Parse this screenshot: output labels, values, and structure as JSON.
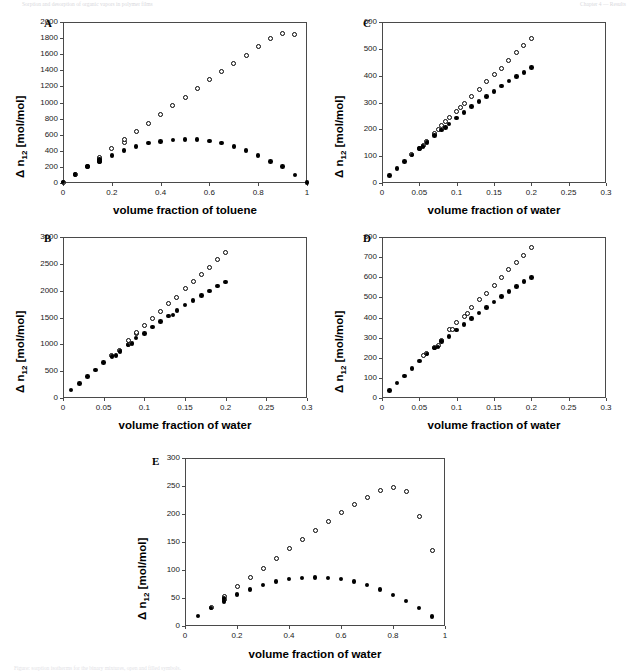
{
  "header": {
    "left": "Sorption and desorption of organic vapors in polymer films",
    "right": "Chapter 4 — Results"
  },
  "figure_caption": "Figure: sorption isotherms for the binary mixtures, open and filled symbols.",
  "axis_common": {
    "ylabel_prefix": "Δ n",
    "ylabel_sub": "12",
    "ylabel_suffix": " [mol/mol]"
  },
  "chart_data": [
    {
      "id": "A",
      "type": "scatter",
      "title": "A",
      "xlabel": "volume fraction of toluene",
      "ylabel": "Δ n12 [mol/mol]",
      "xlim": [
        0,
        1
      ],
      "ylim": [
        0,
        2000
      ],
      "xticks": [
        0,
        0.2,
        0.4,
        0.6,
        0.8,
        1
      ],
      "xtick_labels": [
        "0",
        "0.2",
        "0.4",
        "0.6",
        "0.8",
        "1"
      ],
      "yticks": [
        0,
        200,
        400,
        600,
        800,
        1000,
        1200,
        1400,
        1600,
        1800,
        2000
      ],
      "ytick_labels": [
        "0",
        "200",
        "400",
        "600",
        "800",
        "1000",
        "1200",
        "1400",
        "1600",
        "1800",
        "2000"
      ],
      "grid": false,
      "legend": "none",
      "series": [
        {
          "name": "open-circles",
          "marker": "open",
          "x": [
            0.0,
            0.05,
            0.1,
            0.15,
            0.15,
            0.2,
            0.25,
            0.25,
            0.3,
            0.35,
            0.4,
            0.45,
            0.5,
            0.55,
            0.6,
            0.65,
            0.7,
            0.75,
            0.8,
            0.85,
            0.9,
            0.95
          ],
          "y": [
            10,
            105,
            205,
            270,
            320,
            430,
            500,
            535,
            635,
            745,
            855,
            960,
            1065,
            1175,
            1280,
            1380,
            1480,
            1590,
            1690,
            1790,
            1860,
            1840
          ]
        },
        {
          "name": "filled-circles",
          "marker": "filled",
          "x": [
            0.0,
            0.05,
            0.1,
            0.15,
            0.15,
            0.2,
            0.25,
            0.3,
            0.35,
            0.4,
            0.45,
            0.5,
            0.55,
            0.6,
            0.65,
            0.7,
            0.75,
            0.8,
            0.85,
            0.9,
            0.95,
            1.0
          ],
          "y": [
            10,
            105,
            205,
            265,
            295,
            345,
            405,
            450,
            495,
            515,
            535,
            540,
            538,
            520,
            495,
            455,
            405,
            345,
            270,
            205,
            100,
            8
          ]
        }
      ]
    },
    {
      "id": "B",
      "type": "scatter",
      "title": "B",
      "xlabel": "volume fraction of water",
      "ylabel": "Δ n12 [mol/mol]",
      "xlim": [
        0,
        0.3
      ],
      "ylim": [
        0,
        3000
      ],
      "xticks": [
        0,
        0.05,
        0.1,
        0.15,
        0.2,
        0.25,
        0.3
      ],
      "xtick_labels": [
        "0",
        "0.05",
        "0.1",
        "0.15",
        "0.2",
        "0.25",
        "0.3"
      ],
      "yticks": [
        0,
        500,
        1000,
        1500,
        2000,
        2500,
        3000
      ],
      "ytick_labels": [
        "0",
        "500",
        "1000",
        "1500",
        "2000",
        "2500",
        "3000"
      ],
      "grid": false,
      "legend": "none",
      "series": [
        {
          "name": "open-circles",
          "marker": "open",
          "x": [
            0.06,
            0.07,
            0.08,
            0.08,
            0.09,
            0.09,
            0.1,
            0.11,
            0.12,
            0.13,
            0.14,
            0.15,
            0.16,
            0.17,
            0.18,
            0.19,
            0.2
          ],
          "y": [
            790,
            880,
            1000,
            1080,
            1205,
            1225,
            1355,
            1490,
            1620,
            1760,
            1880,
            2040,
            2175,
            2300,
            2440,
            2580,
            2705
          ]
        },
        {
          "name": "filled-circles",
          "marker": "filled",
          "x": [
            0.01,
            0.02,
            0.03,
            0.04,
            0.05,
            0.06,
            0.065,
            0.07,
            0.08,
            0.085,
            0.09,
            0.1,
            0.11,
            0.12,
            0.13,
            0.135,
            0.14,
            0.15,
            0.16,
            0.17,
            0.18,
            0.19,
            0.2
          ],
          "y": [
            150,
            270,
            400,
            525,
            660,
            770,
            790,
            870,
            990,
            1010,
            1115,
            1205,
            1320,
            1430,
            1530,
            1545,
            1630,
            1730,
            1820,
            1910,
            1995,
            2085,
            2165
          ]
        }
      ]
    },
    {
      "id": "C",
      "type": "scatter",
      "title": "C",
      "xlabel": "volume fraction of water",
      "ylabel": "Δ n12 [mol/mol]",
      "xlim": [
        0,
        0.3
      ],
      "ylim": [
        0,
        600
      ],
      "xticks": [
        0,
        0.05,
        0.1,
        0.15,
        0.2,
        0.25,
        0.3
      ],
      "xtick_labels": [
        "0",
        "0.05",
        "0.1",
        "0.15",
        "0.2",
        "0.25",
        "0.3"
      ],
      "yticks": [
        0,
        100,
        200,
        300,
        400,
        500,
        600
      ],
      "ytick_labels": [
        "0",
        "100",
        "200",
        "300",
        "400",
        "500",
        "600"
      ],
      "grid": false,
      "legend": "none",
      "series": [
        {
          "name": "open-circles",
          "marker": "open",
          "x": [
            0.04,
            0.05,
            0.055,
            0.06,
            0.07,
            0.075,
            0.08,
            0.085,
            0.09,
            0.1,
            0.105,
            0.11,
            0.12,
            0.13,
            0.14,
            0.15,
            0.16,
            0.17,
            0.18,
            0.19,
            0.2
          ],
          "y": [
            105,
            130,
            140,
            155,
            185,
            200,
            215,
            228,
            243,
            268,
            280,
            295,
            323,
            350,
            378,
            403,
            428,
            458,
            485,
            512,
            538
          ]
        },
        {
          "name": "filled-circles",
          "marker": "filled",
          "x": [
            0.01,
            0.02,
            0.03,
            0.04,
            0.05,
            0.055,
            0.06,
            0.07,
            0.08,
            0.085,
            0.09,
            0.1,
            0.11,
            0.12,
            0.13,
            0.14,
            0.15,
            0.16,
            0.17,
            0.18,
            0.19,
            0.2
          ],
          "y": [
            28,
            55,
            80,
            105,
            128,
            137,
            152,
            178,
            198,
            206,
            220,
            242,
            263,
            285,
            303,
            323,
            341,
            362,
            380,
            397,
            412,
            430
          ]
        }
      ]
    },
    {
      "id": "D",
      "type": "scatter",
      "title": "D",
      "xlabel": "volume fraction of water",
      "ylabel": "Δ n12 [mol/mol]",
      "xlim": [
        0,
        0.3
      ],
      "ylim": [
        0,
        800
      ],
      "xticks": [
        0,
        0.05,
        0.1,
        0.15,
        0.2,
        0.25,
        0.3
      ],
      "xtick_labels": [
        "0",
        "0.05",
        "0.1",
        "0.15",
        "0.2",
        "0.25",
        "0.3"
      ],
      "yticks": [
        0,
        100,
        200,
        300,
        400,
        500,
        600,
        700,
        800
      ],
      "ytick_labels": [
        "0",
        "100",
        "200",
        "300",
        "400",
        "500",
        "600",
        "700",
        "800"
      ],
      "grid": false,
      "legend": "none",
      "series": [
        {
          "name": "open-circles",
          "marker": "open",
          "x": [
            0.055,
            0.06,
            0.07,
            0.075,
            0.08,
            0.09,
            0.095,
            0.1,
            0.11,
            0.115,
            0.12,
            0.13,
            0.14,
            0.15,
            0.16,
            0.17,
            0.18,
            0.19,
            0.2
          ],
          "y": [
            210,
            222,
            250,
            262,
            288,
            338,
            340,
            375,
            405,
            420,
            450,
            487,
            520,
            560,
            600,
            638,
            675,
            710,
            748
          ]
        },
        {
          "name": "filled-circles",
          "marker": "filled",
          "x": [
            0.01,
            0.02,
            0.03,
            0.04,
            0.05,
            0.06,
            0.07,
            0.075,
            0.08,
            0.09,
            0.1,
            0.11,
            0.12,
            0.13,
            0.14,
            0.15,
            0.16,
            0.17,
            0.18,
            0.19,
            0.2
          ],
          "y": [
            37,
            75,
            110,
            148,
            183,
            218,
            248,
            253,
            280,
            305,
            338,
            365,
            395,
            422,
            450,
            477,
            503,
            528,
            553,
            578,
            600
          ]
        }
      ]
    },
    {
      "id": "E",
      "type": "scatter",
      "title": "E",
      "xlabel": "volume fraction of water",
      "ylabel": "Δ n12 [mol/mol]",
      "xlim": [
        0,
        1
      ],
      "ylim": [
        0,
        300
      ],
      "xticks": [
        0,
        0.2,
        0.4,
        0.6,
        0.8,
        1
      ],
      "xtick_labels": [
        "0",
        "0.2",
        "0.4",
        "0.6",
        "0.8",
        "1"
      ],
      "yticks": [
        0,
        50,
        100,
        150,
        200,
        250,
        300
      ],
      "ytick_labels": [
        "0",
        "50",
        "100",
        "150",
        "200",
        "250",
        "300"
      ],
      "grid": false,
      "legend": "none",
      "series": [
        {
          "name": "open-circles",
          "marker": "open",
          "x": [
            0.1,
            0.15,
            0.15,
            0.2,
            0.25,
            0.3,
            0.35,
            0.4,
            0.45,
            0.5,
            0.55,
            0.6,
            0.65,
            0.7,
            0.75,
            0.8,
            0.85,
            0.9,
            0.95
          ],
          "y": [
            33,
            48,
            53,
            70,
            87,
            103,
            121,
            138,
            154,
            170,
            186,
            202,
            217,
            230,
            242,
            248,
            240,
            195,
            135
          ]
        },
        {
          "name": "filled-circles",
          "marker": "filled",
          "x": [
            0.05,
            0.1,
            0.15,
            0.15,
            0.2,
            0.25,
            0.3,
            0.35,
            0.4,
            0.45,
            0.5,
            0.55,
            0.6,
            0.65,
            0.7,
            0.75,
            0.8,
            0.85,
            0.9,
            0.95
          ],
          "y": [
            18,
            32,
            44,
            49,
            56,
            65,
            73,
            79,
            84,
            86,
            87,
            86,
            84,
            79,
            73,
            65,
            55,
            45,
            32,
            17
          ]
        }
      ]
    }
  ]
}
